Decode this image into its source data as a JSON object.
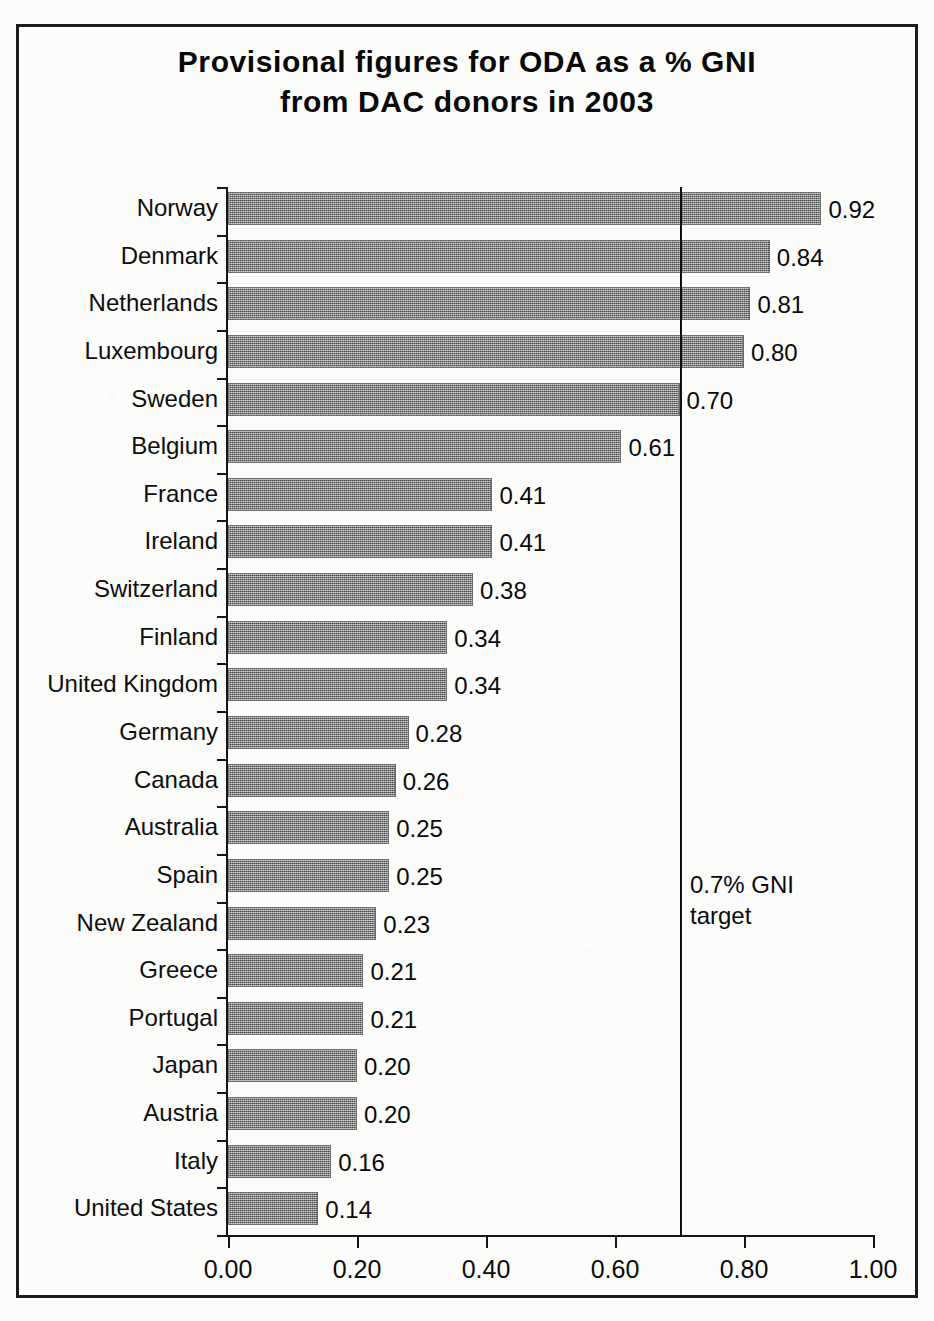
{
  "chart_data": {
    "type": "bar",
    "orientation": "horizontal",
    "title": "Provisional figures for ODA as a % GNI\nfrom DAC donors in 2003",
    "title_line1": "Provisional figures for ODA as a % GNI",
    "title_line2": "from DAC donors in 2003",
    "xlabel": "",
    "ylabel": "",
    "xlim": [
      0.0,
      1.0
    ],
    "grid": false,
    "legend": false,
    "bar_color": "#8a8a8a",
    "axis_color": "#151515",
    "categories": [
      "Norway",
      "Denmark",
      "Netherlands",
      "Luxembourg",
      "Sweden",
      "Belgium",
      "France",
      "Ireland",
      "Switzerland",
      "Finland",
      "United Kingdom",
      "Germany",
      "Canada",
      "Australia",
      "Spain",
      "New Zealand",
      "Greece",
      "Portugal",
      "Japan",
      "Austria",
      "Italy",
      "United States"
    ],
    "values": [
      0.92,
      0.84,
      0.81,
      0.8,
      0.7,
      0.61,
      0.41,
      0.41,
      0.38,
      0.34,
      0.34,
      0.28,
      0.26,
      0.25,
      0.25,
      0.23,
      0.21,
      0.21,
      0.2,
      0.2,
      0.16,
      0.14
    ],
    "value_labels": [
      "0.92",
      "0.84",
      "0.81",
      "0.80",
      "0.70",
      "0.61",
      "0.41",
      "0.41",
      "0.38",
      "0.34",
      "0.34",
      "0.28",
      "0.26",
      "0.25",
      "0.25",
      "0.23",
      "0.21",
      "0.21",
      "0.20",
      "0.20",
      "0.16",
      "0.14"
    ],
    "xticks": [
      0.0,
      0.2,
      0.4,
      0.6,
      0.8,
      1.0
    ],
    "xtick_labels": [
      "0.00",
      "0.20",
      "0.40",
      "0.60",
      "0.80",
      "1.00"
    ],
    "annotations": [
      {
        "name": "gni-target",
        "text": "0.7% GNI\ntarget",
        "line1": "0.7% GNI",
        "line2": "target",
        "value": 0.7,
        "type": "vertical-reference-line"
      }
    ]
  }
}
